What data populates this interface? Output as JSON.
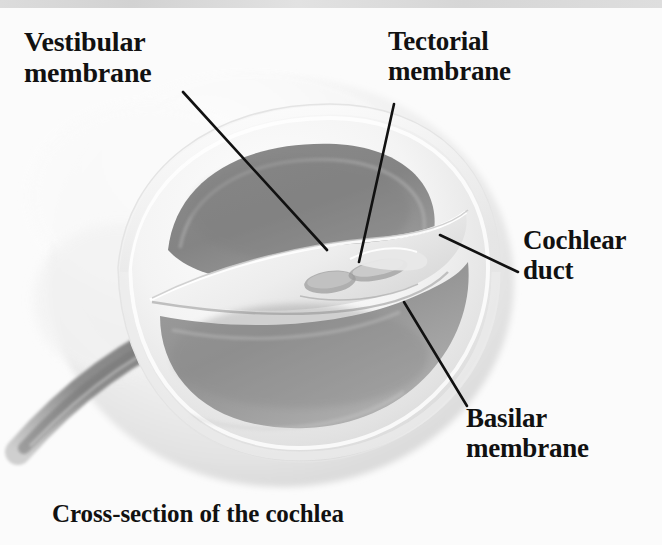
{
  "figure": {
    "caption": "Cross-section of the cochlea",
    "background_color": "#fbfbfb",
    "ink_color": "#111111"
  },
  "labels": {
    "vestibular_membrane": "Vestibular\nmembrane",
    "tectorial_membrane": "Tectorial\nmembrane",
    "cochlear_duct": "Cochlear\nduct",
    "basilar_membrane": "Basilar\nmembrane"
  },
  "anatomy": {
    "scala_vestibuli_color": "#8e8e8e",
    "scala_tympani_color": "#9a9a9a",
    "outer_wall_color": "#f0f0f0",
    "spiral_band_color": "#8a8a8a",
    "structures": [
      "scala vestibuli",
      "scala tympani",
      "cochlear duct",
      "vestibular membrane",
      "basilar membrane",
      "tectorial membrane",
      "organ of Corti",
      "modiolus / spiral continuation"
    ]
  },
  "leader_lines": [
    {
      "name": "vestibular-membrane-leader",
      "x1": 183,
      "y1": 92,
      "x2": 327,
      "y2": 250
    },
    {
      "name": "tectorial-membrane-leader",
      "x1": 394,
      "y1": 104,
      "x2": 359,
      "y2": 262
    },
    {
      "name": "cochlear-duct-leader",
      "x1": 518,
      "y1": 272,
      "x2": 440,
      "y2": 235
    },
    {
      "name": "basilar-membrane-leader",
      "x1": 404,
      "y1": 302,
      "x2": 467,
      "y2": 406
    }
  ]
}
